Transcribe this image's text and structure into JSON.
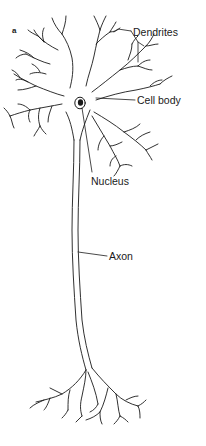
{
  "figure": {
    "panel_letter": "a",
    "labels": {
      "dendrites": "Dendrites",
      "cell_body": "Cell body",
      "nucleus": "Nucleus",
      "axon": "Axon"
    },
    "colors": {
      "line": "#1a1a1a",
      "background": "#ffffff"
    }
  }
}
